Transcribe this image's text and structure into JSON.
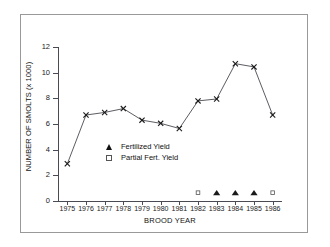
{
  "chart_data": {
    "type": "line",
    "title": "",
    "xlabel": "BROOD YEAR",
    "ylabel": "NUMBER OF SMOLTS (x 1000)",
    "categories": [
      "1975",
      "1976",
      "1977",
      "1978",
      "1979",
      "1980",
      "1981",
      "1982",
      "1983",
      "1984",
      "1985",
      "1986"
    ],
    "x": [
      1975,
      1976,
      1977,
      1978,
      1979,
      1980,
      1981,
      1982,
      1983,
      1984,
      1985,
      1986
    ],
    "values": [
      2.9,
      6.7,
      6.9,
      7.2,
      6.3,
      6.05,
      5.65,
      7.8,
      7.95,
      10.7,
      10.45,
      6.7
    ],
    "ylim": [
      0,
      12
    ],
    "yticks": [
      0,
      2,
      4,
      6,
      8,
      10,
      12
    ],
    "xlim": [
      1975,
      1986
    ],
    "grid": false,
    "legend_position": "center-left-inside",
    "series": [
      {
        "name": "Smolt Yield",
        "marker": "x-cross",
        "line": true,
        "values": [
          2.9,
          6.7,
          6.9,
          7.2,
          6.3,
          6.05,
          5.65,
          7.8,
          7.95,
          10.7,
          10.45,
          6.7
        ]
      },
      {
        "name": "Fertilized Yield",
        "marker": "filled-triangle",
        "line": false,
        "points": [
          {
            "x": 1983,
            "y": 0.65
          },
          {
            "x": 1984,
            "y": 0.65
          },
          {
            "x": 1985,
            "y": 0.65
          }
        ]
      },
      {
        "name": "Partial Fert. Yield",
        "marker": "open-square",
        "line": false,
        "points": [
          {
            "x": 1982,
            "y": 0.65
          },
          {
            "x": 1986,
            "y": 0.65
          }
        ]
      }
    ],
    "legend": [
      {
        "label": "Fertilized Yield",
        "marker": "filled-triangle"
      },
      {
        "label": "Partial Fert. Yield",
        "marker": "open-square"
      }
    ],
    "colors": {
      "line": "#4a4a52",
      "marker": "#1a1a1a",
      "axis": "#4a4a52",
      "frame": "#999999",
      "text": "#111111",
      "background": "#ffffff"
    }
  }
}
